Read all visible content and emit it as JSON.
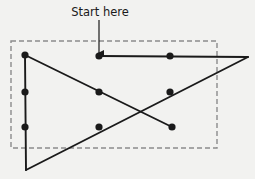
{
  "figure": {
    "title": "",
    "background_color": "#f2f2f0",
    "stroke_color": "#1a1a1a",
    "dash_color": "#8c8c8c",
    "width": 255,
    "height": 179
  },
  "annotation": {
    "label": "Start here",
    "label_x": 100,
    "label_y": 16,
    "arrow_from_x": 99,
    "arrow_from_y": 20,
    "arrow_to_x": 99,
    "arrow_to_y": 53
  },
  "dashed_box": {
    "x": 11,
    "y": 41,
    "width": 206,
    "height": 107,
    "dash_pattern": "5,3"
  },
  "chart_data": {
    "type": "scatter",
    "title": "Start here",
    "xlabel": "",
    "ylabel": "",
    "xlim": [
      0,
      255
    ],
    "ylim": [
      179,
      0
    ],
    "grid": false,
    "legend": null,
    "points": [
      {
        "id": "p1",
        "x": 25,
        "y": 55,
        "label": "top-left"
      },
      {
        "id": "p2",
        "x": 25,
        "y": 92,
        "label": "left-middle"
      },
      {
        "id": "p3",
        "x": 25,
        "y": 127,
        "label": "left-lower"
      },
      {
        "id": "p4",
        "x": 99,
        "y": 56,
        "label": "start"
      },
      {
        "id": "p5",
        "x": 170,
        "y": 56,
        "label": "top-right-inner"
      },
      {
        "id": "p6",
        "x": 99,
        "y": 92,
        "label": "center-left-upper"
      },
      {
        "id": "p7",
        "x": 170,
        "y": 92,
        "label": "center-right-upper"
      },
      {
        "id": "p8",
        "x": 99,
        "y": 127,
        "label": "center-left-lower"
      },
      {
        "id": "p9",
        "x": 172,
        "y": 127,
        "label": "center-right-lower"
      }
    ],
    "vertices": [
      {
        "id": "v1",
        "x": 248,
        "y": 57,
        "label": "far-right"
      },
      {
        "id": "v2",
        "x": 26,
        "y": 170,
        "label": "bottom"
      }
    ],
    "segments": [
      {
        "id": "s1",
        "name": "top-horizontal",
        "x1": 99,
        "y1": 56,
        "x2": 248,
        "y2": 57
      },
      {
        "id": "s2",
        "name": "right-descending",
        "x1": 248,
        "y1": 57,
        "x2": 26,
        "y2": 170
      },
      {
        "id": "s3",
        "name": "left-vertical",
        "x1": 25,
        "y1": 55,
        "x2": 26,
        "y2": 170
      },
      {
        "id": "s4",
        "name": "diagonal-down",
        "x1": 25,
        "y1": 55,
        "x2": 172,
        "y2": 127
      }
    ]
  }
}
